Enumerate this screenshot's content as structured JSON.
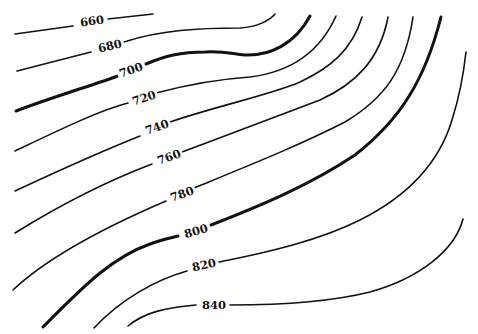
{
  "map": {
    "type": "topographic contour map",
    "contour_interval": 20,
    "index_contours": [
      700,
      800
    ],
    "line_color": "#111111",
    "background": "#ffffff",
    "contours": [
      {
        "elevation": 660,
        "label": "660"
      },
      {
        "elevation": 680,
        "label": "680"
      },
      {
        "elevation": 700,
        "label": "700"
      },
      {
        "elevation": 720,
        "label": "720"
      },
      {
        "elevation": 740,
        "label": "740"
      },
      {
        "elevation": 760,
        "label": "760"
      },
      {
        "elevation": 780,
        "label": "780"
      },
      {
        "elevation": 800,
        "label": "800"
      },
      {
        "elevation": 820,
        "label": "820"
      },
      {
        "elevation": 840,
        "label": "840"
      }
    ]
  }
}
